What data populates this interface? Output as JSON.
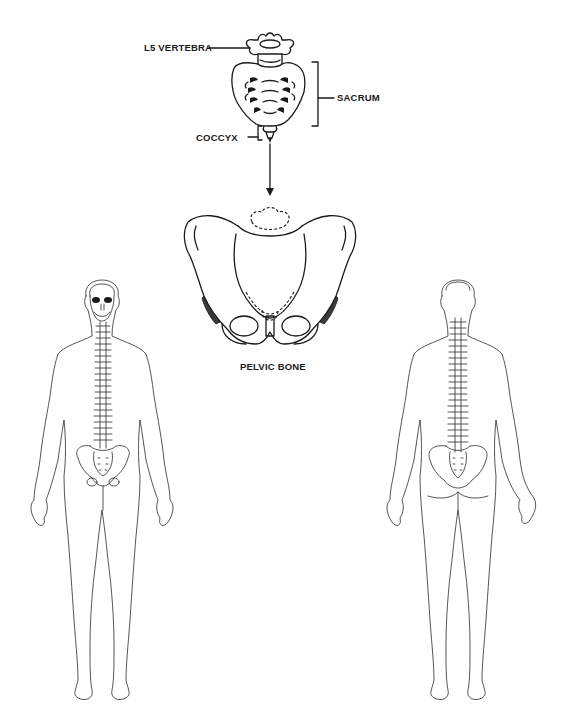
{
  "diagram": {
    "labels": {
      "l5_vertebra": "L5 VERTEBRA",
      "sacrum": "SACRUM",
      "coccyx": "COCCYX",
      "pelvic_bone": "PELVIC BONE"
    },
    "figures": {
      "front_view": "Anterior body outline with skull, spine and pelvis",
      "back_view": "Posterior body outline with spine and pelvis"
    },
    "colors": {
      "line": "#1a1a1a",
      "background": "#ffffff"
    }
  }
}
